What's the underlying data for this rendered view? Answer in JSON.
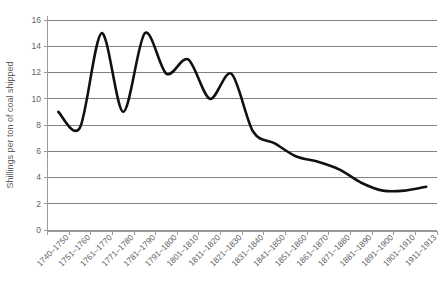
{
  "chart_data": {
    "type": "line",
    "title": "",
    "xlabel": "",
    "ylabel": "Shillings per ton of coal shipped",
    "ylim": [
      0,
      16
    ],
    "ytick_step": 2,
    "yticks": [
      0,
      2,
      4,
      6,
      8,
      10,
      12,
      14,
      16
    ],
    "grid": true,
    "legend": "none",
    "line_color": "#111111",
    "grid_color": "#808080",
    "axis_color": "#9a9a9a",
    "categories": [
      "1740–1750",
      "1751–1760",
      "1761–1770",
      "1771–1780",
      "1781–1790",
      "1791–1800",
      "1801–1810",
      "1811–1820",
      "1821–1830",
      "1831–1840",
      "1841–1850",
      "1851–1860",
      "1861–1870",
      "1871–1880",
      "1881–1890",
      "1891–1900",
      "1901–1910",
      "1911–1913"
    ],
    "values": [
      9.0,
      7.8,
      15.0,
      9.0,
      15.0,
      11.9,
      13.0,
      10.0,
      11.9,
      7.5,
      6.6,
      5.6,
      5.2,
      4.6,
      3.6,
      3.0,
      3.0,
      3.3
    ]
  }
}
